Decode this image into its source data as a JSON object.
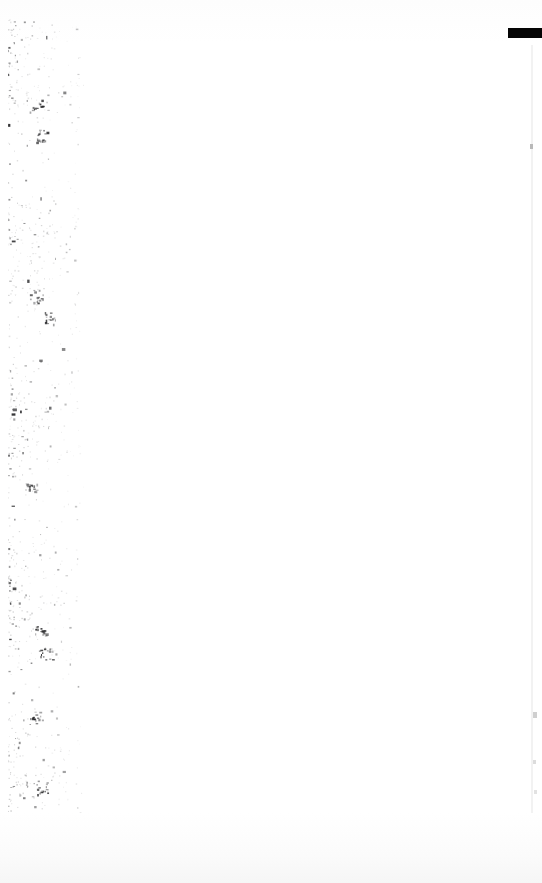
{
  "document": {
    "kind": "scanned-page",
    "page_label": "",
    "body_text": "",
    "width": 542,
    "height": 883,
    "background_color": "#ffffff"
  },
  "artifacts": {
    "redaction_bar": {
      "name": "redaction-bar",
      "color": "#050505",
      "x": 508,
      "y": 28,
      "width": 34,
      "height": 10
    },
    "speckle_band": {
      "name": "binding-edge-speckle",
      "color": "#3a3a3a",
      "x": 6,
      "y": 18,
      "width": 78,
      "height": 854,
      "density": 1500
    },
    "edge_marks": [
      {
        "name": "right-edge-mark-upper",
        "color": "#b9b9b9",
        "x": 530,
        "y": 144,
        "width": 3,
        "height": 5
      },
      {
        "name": "right-edge-mark-mid",
        "color": "#cfcfcf",
        "x": 533,
        "y": 712,
        "width": 4,
        "height": 6
      },
      {
        "name": "right-edge-mark-lower",
        "color": "#dcdcdc",
        "x": 533,
        "y": 760,
        "width": 3,
        "height": 4
      },
      {
        "name": "right-edge-mark-bottom",
        "color": "#e2e2e2",
        "x": 534,
        "y": 790,
        "width": 3,
        "height": 4
      }
    ],
    "edge_line": {
      "name": "right-page-edge-line",
      "color": "#f2f2f2",
      "x": 531,
      "y": 45,
      "width": 2,
      "height": 800
    }
  }
}
